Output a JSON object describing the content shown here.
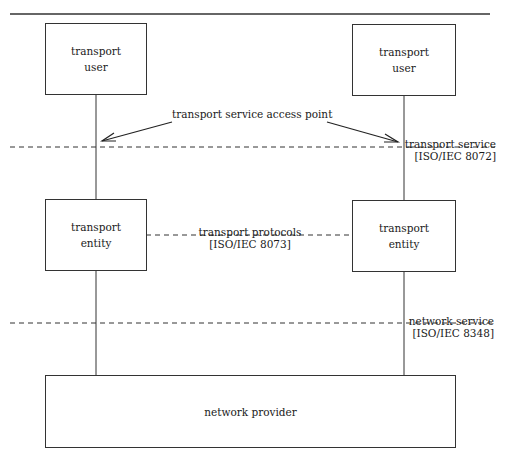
{
  "boxes": {
    "user_left": {
      "line1": "transport",
      "line2": "user"
    },
    "user_right": {
      "line1": "transport",
      "line2": "user"
    },
    "entity_left": {
      "line1": "transport",
      "line2": "entity"
    },
    "entity_right": {
      "line1": "transport",
      "line2": "entity"
    },
    "network_provider": {
      "label": "network provider"
    }
  },
  "labels": {
    "access_point": "transport service access point",
    "transport_service": {
      "line1": "transport service",
      "line2": "[ISO/IEC 8072]"
    },
    "transport_protocols": {
      "line1": "transport protocols",
      "line2": "[ISO/IEC 8073]"
    },
    "network_service": {
      "line1": "network service",
      "line2": "[ISO/IEC 8348]"
    }
  },
  "colors": {
    "line": "#333333",
    "background": "#ffffff"
  }
}
